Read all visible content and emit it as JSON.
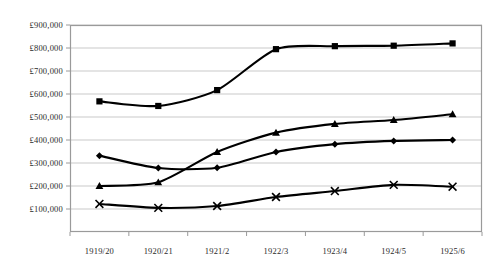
{
  "chart_data": {
    "type": "line",
    "title": "",
    "xlabel": "",
    "ylabel": "",
    "categories": [
      "1919/20",
      "1920/21",
      "1921/2",
      "1922/3",
      "1923/4",
      "1924/5",
      "1925/6"
    ],
    "ylim": [
      0,
      900000
    ],
    "ytick_values": [
      100000,
      200000,
      300000,
      400000,
      500000,
      600000,
      700000,
      800000,
      900000
    ],
    "ytick_labels": [
      "£100,000",
      "£200,000",
      "£300,000",
      "£400,000",
      "£500,000",
      "£600,000",
      "£700,000",
      "£800,000",
      "£900,000"
    ],
    "grid": true,
    "legend": "none",
    "series": [
      {
        "name": "series-square",
        "marker": "square",
        "color": "#000000",
        "values": [
          568000,
          548000,
          617000,
          795000,
          808000,
          810000,
          820000
        ]
      },
      {
        "name": "series-triangle",
        "marker": "triangle",
        "color": "#000000",
        "values": [
          200000,
          216000,
          348000,
          432000,
          470000,
          487000,
          512000
        ]
      },
      {
        "name": "series-diamond",
        "marker": "diamond",
        "color": "#000000",
        "values": [
          332000,
          278000,
          279000,
          348000,
          382000,
          396000,
          400000
        ]
      },
      {
        "name": "series-cross",
        "marker": "cross",
        "color": "#000000",
        "values": [
          122000,
          105000,
          113000,
          152000,
          178000,
          205000,
          197000
        ]
      }
    ]
  },
  "axes": {
    "plot_left": 70,
    "plot_right": 482,
    "plot_top": 25,
    "plot_bottom": 232,
    "frame_color": "#9a9a9a",
    "grid_color": "#c9c9c9",
    "line_color": "#000000"
  }
}
